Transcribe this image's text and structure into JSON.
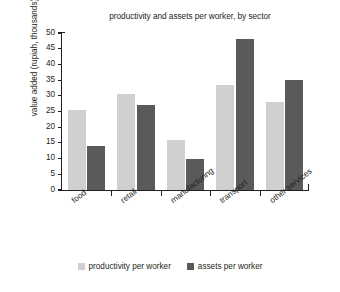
{
  "chart_data": {
    "type": "bar",
    "title": "productivity and assets per worker, by sector",
    "xlabel": "",
    "ylabel": "value added (rupiah, thousands)",
    "categories": [
      "food",
      "retail",
      "manufacturing",
      "transport",
      "other services"
    ],
    "series": [
      {
        "name": "productivity per worker",
        "color": "#d0d0d0",
        "values": [
          25.5,
          30.5,
          16,
          33.5,
          28
        ]
      },
      {
        "name": "assets per worker",
        "color": "#5a5a5a",
        "values": [
          14,
          27,
          10,
          48,
          35
        ]
      }
    ],
    "ylim": [
      0,
      50
    ],
    "ytick_labels": [
      "0",
      "5",
      "10",
      "15",
      "20",
      "25",
      "30",
      "35",
      "40",
      "45",
      "50"
    ],
    "ytick_values": [
      0,
      5,
      10,
      15,
      20,
      25,
      30,
      35,
      40,
      45,
      50
    ],
    "grid": false,
    "legend_position": "bottom"
  }
}
